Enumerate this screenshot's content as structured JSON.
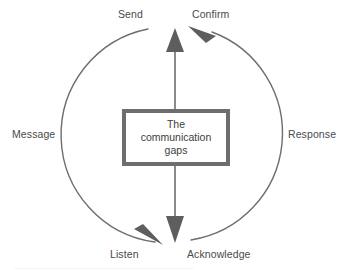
{
  "diagram": {
    "type": "cycle-diagram",
    "center_box": {
      "text": "The\ncommunication\ngaps",
      "border_color": "#6e6e6e",
      "fill_color": "#ffffff"
    },
    "labels": {
      "send": "Send",
      "confirm": "Confirm",
      "message": "Message",
      "response": "Response",
      "listen": "Listen",
      "acknowledge": "Acknowledge"
    },
    "colors": {
      "stroke": "#6e6e6e",
      "arrow_fill": "#5e5e5e",
      "text": "#4a4a4a",
      "background": "#ffffff"
    },
    "arrows": {
      "vertical_up": "up",
      "vertical_down": "down",
      "left_arc_direction": "clockwise-up-toward-send",
      "right_arc_direction": "clockwise-down-toward-listen"
    }
  }
}
